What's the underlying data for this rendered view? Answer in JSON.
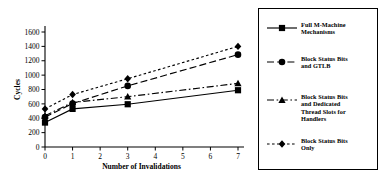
{
  "chart_data": {
    "type": "line",
    "title": "",
    "xlabel": "Number of Invalidations",
    "ylabel": "Cycles",
    "xlim": [
      0,
      7
    ],
    "ylim": [
      0,
      1600
    ],
    "x": [
      0,
      1,
      3,
      7
    ],
    "xticks": [
      "0",
      "1",
      "2",
      "3",
      "4",
      "5",
      "6",
      "7"
    ],
    "yticks": [
      "0",
      "200",
      "400",
      "600",
      "800",
      "1000",
      "1200",
      "1400",
      "1600"
    ],
    "grid": false,
    "legend_position": "right",
    "series": [
      {
        "name": "Full M-Machine Mechanisms",
        "marker": "square",
        "linestyle": "solid",
        "values": [
          340,
          530,
          595,
          790
        ]
      },
      {
        "name": "Block Status Bits and GTLB",
        "marker": "circle",
        "linestyle": "dashed",
        "values": [
          415,
          605,
          850,
          1285
        ]
      },
      {
        "name": "Block Status Bits and Dedicated Thread Slots for Handlers",
        "marker": "triangle",
        "linestyle": "dashdot",
        "values": [
          435,
          620,
          700,
          885
        ]
      },
      {
        "name": "Block Status Bits Only",
        "marker": "diamond",
        "linestyle": "dotted",
        "values": [
          530,
          730,
          950,
          1400
        ]
      }
    ]
  },
  "legend": {
    "entries": [
      {
        "label": "Full M-Machine\nMechanisms",
        "marker": "square",
        "linestyle": "solid"
      },
      {
        "label": "Block Status Bits\nand GTLB",
        "marker": "circle",
        "linestyle": "dashed"
      },
      {
        "label": "Block Status Bits\nand Dedicated\nThread Slots for\nHandlers",
        "marker": "triangle",
        "linestyle": "dashdot"
      },
      {
        "label": "Block Status Bits\nOnly",
        "marker": "diamond",
        "linestyle": "dotted"
      }
    ]
  },
  "colors": {
    "ink": "#000000",
    "background": "#ffffff"
  }
}
